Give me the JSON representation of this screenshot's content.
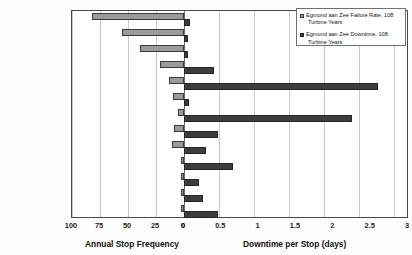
{
  "chart_data": {
    "type": "bar",
    "orientation": "horizontal",
    "layout": "bidirectional-paired-bars",
    "title": "",
    "subtitle": "",
    "categories": [
      "Control System",
      "Yaw System",
      "Scheduled Service",
      "Pitch System",
      "Gearbox",
      "Ambient",
      "Generator",
      "Converter",
      "Electrical",
      "Blade System",
      "Structure",
      "Grid",
      "Brake System"
    ],
    "series": [
      {
        "name": "Egmond aan Zee Failure Rate, 108 Turbine Years",
        "axis": "left",
        "color": "#9a9a9a",
        "unit": "stops/year",
        "values": [
          82,
          55,
          39,
          21,
          13,
          10,
          5,
          9,
          11,
          3,
          3,
          3,
          3
        ]
      },
      {
        "name": "Egmond aan Zee Downtime, 108 Turbine Years",
        "axis": "right",
        "color": "#3c3c3c",
        "unit": "days",
        "values": [
          0.08,
          0.06,
          0.06,
          0.4,
          2.6,
          0.07,
          2.25,
          0.45,
          0.3,
          0.65,
          0.2,
          0.25,
          0.45
        ]
      }
    ],
    "left_axis": {
      "label": "Annual Stop Frequency",
      "ticks": [
        "100",
        "75",
        "50",
        "25",
        "0"
      ],
      "tick_values": [
        100,
        75,
        50,
        25,
        0
      ],
      "range": [
        100,
        0
      ],
      "direction": "reversed"
    },
    "right_axis": {
      "label": "Downtime per Stop (days)",
      "ticks": [
        "0",
        "0.5",
        "1",
        "1.5",
        "2",
        "2.5",
        "3"
      ],
      "tick_values": [
        0,
        0.5,
        1,
        1.5,
        2,
        2.5,
        3
      ],
      "range": [
        0,
        3
      ]
    },
    "grid": true,
    "legend_position": "top-right"
  },
  "legend": {
    "entries": [
      {
        "line1": "Egmond aan Zee Failure Rate, 108",
        "line2": "Turbine Years",
        "swatch": "light-gray-square"
      },
      {
        "line1": "Egmond aan Zee Downtime, 108",
        "line2": "Turbine Years",
        "swatch": "dark-gray-square"
      }
    ]
  }
}
